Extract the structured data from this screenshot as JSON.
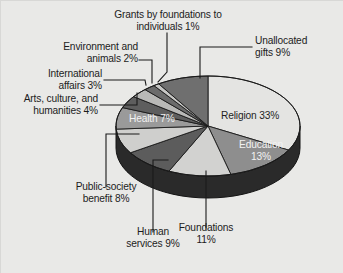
{
  "figure": {
    "background_color": "#e9e9e7",
    "text_color": "#1c1c1c",
    "inner_light_text_color": "#f2f2f2"
  },
  "chart_data": {
    "type": "pie",
    "title": "",
    "subtitle": "",
    "xlabel": "",
    "ylabel": "",
    "legend_position": "none",
    "grid": false,
    "three_d": true,
    "start_angle_deg": 0,
    "direction": "clockwise",
    "units": "percent",
    "total": 100,
    "categories": [
      "Religion",
      "Education",
      "Foundations",
      "Human services",
      "Public-society benefit",
      "Health",
      "Arts, culture, and humanities",
      "International affairs",
      "Environment and animals",
      "Grants by foundations to individuals",
      "Unallocated gifts"
    ],
    "values": [
      33,
      13,
      11,
      9,
      8,
      7,
      4,
      3,
      2,
      1,
      9
    ],
    "slice_colors": [
      "#e4e4e2",
      "#8e8e8e",
      "#d2d2d0",
      "#5c5c5c",
      "#cfcfcd",
      "#9a9a9a",
      "#5e5e5e",
      "#b9b9b7",
      "#6b6b6b",
      "#c6c6c4",
      "#6f6f6f"
    ],
    "side_color": "#2a2a2a",
    "outline_color": "#1a1a1a"
  },
  "slice_labels": {
    "religion": "Religion 33%",
    "education": "Education\n13%",
    "health": "Health 7%",
    "foundations": "Foundations\n11%",
    "human_services": "Human\nservices 9%",
    "public_society": "Public-society\nbenefit 8%",
    "arts": "Arts, culture, and\nhumanities 4%",
    "international": "International\naffairs 3%",
    "environment": "Environment and\nanimals 2%",
    "grants": "Grants by foundations to\nindividuals 1%",
    "unallocated": "Unallocated\ngifts 9%"
  }
}
